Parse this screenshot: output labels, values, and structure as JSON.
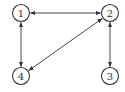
{
  "diagram": {
    "type": "directed-graph",
    "nodes": [
      {
        "id": "1",
        "label": "1"
      },
      {
        "id": "2",
        "label": "2"
      },
      {
        "id": "3",
        "label": "3"
      },
      {
        "id": "4",
        "label": "4"
      }
    ],
    "edges": [
      {
        "from": "1",
        "to": "2",
        "direction": "both"
      },
      {
        "from": "1",
        "to": "4",
        "direction": "both"
      },
      {
        "from": "2",
        "to": "4",
        "direction": "both"
      },
      {
        "from": "2",
        "to": "3",
        "direction": "both"
      }
    ],
    "colors": {
      "stroke": "#333333",
      "fill": "#ffffff",
      "background": "#ffffff"
    }
  }
}
